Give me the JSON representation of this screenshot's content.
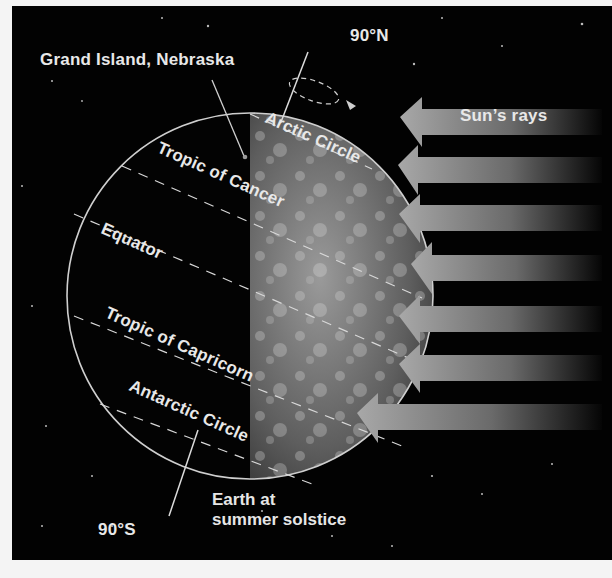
{
  "figure": {
    "title": "Earth at summer solstice",
    "labels": {
      "location": "Grand Island, Nebraska",
      "north_pole": "90°N",
      "south_pole": "90°S",
      "sun_rays": "Sun’s rays",
      "arctic_circle": "Arctic Circle",
      "tropic_of_cancer": "Tropic of Cancer",
      "equator": "Equator",
      "tropic_of_capricorn": "Tropic of Capricorn",
      "antarctic_circle": "Antarctic Circle"
    },
    "caption_line1": "Earth at",
    "caption_line2": "summer solstice",
    "sun_ray_count": 7,
    "colors": {
      "background": "#020202",
      "text": "#e8e8e8",
      "ray_light": "#9a9a9a",
      "earth_day": "#7a7a7a",
      "page": "#f4f4f4"
    }
  }
}
